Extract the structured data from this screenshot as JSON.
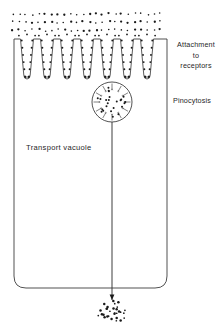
{
  "figure": {
    "background_color": "#ffffff",
    "stroke_color": "#333333",
    "dot_color": "#1a1a1a"
  },
  "labels": {
    "attachment_line1": "Attachment",
    "attachment_line2": "to",
    "attachment_line3": "receptors",
    "pinocytosis": "Pinocytosis",
    "transport_vacuole": "Transport  vacuole"
  },
  "cell": {
    "left": 14,
    "right": 167,
    "top": 39,
    "bottom": 288,
    "corner_radius": 12
  },
  "extracellular_dots": {
    "rows": 3,
    "row_y": [
      14,
      22,
      30
    ],
    "columns": 24,
    "x_start": 13,
    "x_step": 6.4,
    "description": "scattered ligand molecules outside the cell"
  },
  "invaginations": {
    "count": 7,
    "centers_x": [
      27,
      47,
      67,
      87,
      107,
      127,
      147
    ],
    "mouth_y": 39,
    "depth_y": 79,
    "half_width_top": 6.5,
    "half_width_bottom": 3.2,
    "lining_dot_rows": 5,
    "description": "coated pits lined with receptor-bound ligand"
  },
  "vesicle": {
    "center_x": 112,
    "center_y": 102,
    "radius": 20,
    "inner_dots": 24,
    "inward_arrows": 12,
    "description": "pinocytotic vesicle with internalized ligand"
  },
  "transport_stalk": {
    "x": 112,
    "y_top": 122,
    "y_bottom": 300,
    "description": "transport vacuole path toward cell interior"
  },
  "release_cluster": {
    "center_x": 112,
    "center_y": 312,
    "dots": 30,
    "spread_x": 15,
    "spread_y": 11,
    "description": "released contents after vacuole discharge"
  },
  "chart_data": {
    "type": "diagram",
    "stages": [
      {
        "order": 1,
        "name": "Attachment to receptors",
        "y": 55
      },
      {
        "order": 2,
        "name": "Pinocytosis",
        "y": 102
      },
      {
        "order": 3,
        "name": "Transport vacuole",
        "y": 150
      },
      {
        "order": 4,
        "name": "Release of contents",
        "y": 312
      }
    ]
  }
}
